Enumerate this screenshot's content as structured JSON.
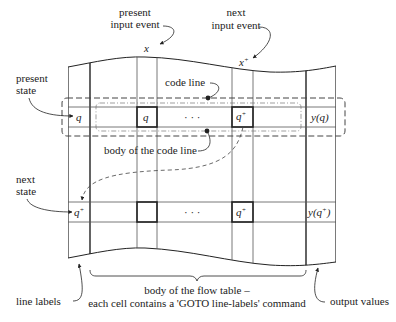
{
  "diagram": {
    "colors": {
      "line": "#222222",
      "thin_line": "#555555",
      "dashed": "#444444",
      "background": "#ffffff"
    },
    "annotations": {
      "present_input": [
        "present",
        "input event"
      ],
      "next_input": [
        "next",
        "input event"
      ],
      "present_state": [
        "present",
        "state"
      ],
      "next_state": [
        "next",
        "state"
      ],
      "code_line": "code line",
      "body_code_line": "body of the code line",
      "body_flow_table": [
        "body of the flow table –",
        "each cell contains a 'GOTO line-labels' command"
      ],
      "line_labels": "line labels",
      "output_values": "output values"
    },
    "column_labels": {
      "present_input_symbol": "x",
      "next_input_symbol": "x",
      "next_input_sup": "+"
    },
    "rows": {
      "present": {
        "label": "q",
        "cell_x": "q",
        "ellipsis": "· · ·",
        "cell_x_plus": "q",
        "cell_x_plus_sup": "+",
        "output": "y(q)"
      },
      "next": {
        "label": "q",
        "label_sup": "+",
        "cell_x": "",
        "ellipsis": "· · ·",
        "cell_x_plus": "q",
        "cell_x_plus_sup": "+",
        "output_prefix": "y(q",
        "output_sup": "+",
        "output_suffix": ")"
      }
    }
  }
}
